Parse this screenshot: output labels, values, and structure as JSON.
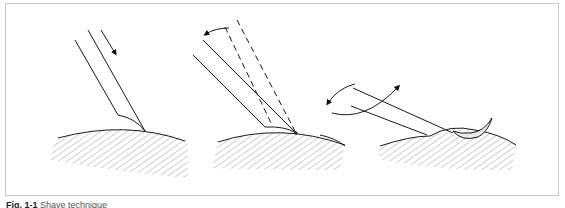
{
  "figure": {
    "panels": [
      {
        "id": "panel-1",
        "description": "Blade approaching skin surface, arrow indicating downward insertion"
      },
      {
        "id": "panel-2",
        "description": "Blade tip on surface with dashed outline showing prior angle, curved arrow indicating tilting"
      },
      {
        "id": "panel-3",
        "description": "Blade lowered nearly parallel to surface lifting a shaved curl of tissue, rotation arrows"
      }
    ],
    "colors": {
      "line": "#1a1a1a",
      "hatch": "#7a7a7a",
      "frame": "#c8c8c8"
    }
  },
  "caption": {
    "label": "Fig. 1-1",
    "text": "Shave technique"
  }
}
